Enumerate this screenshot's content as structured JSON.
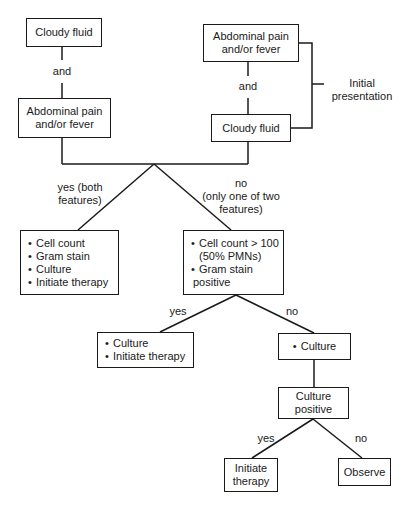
{
  "diagram": {
    "top_left": {
      "box1": "Cloudy fluid",
      "connector": "and",
      "box2_line1": "Abdominal pain",
      "box2_line2": "and/or fever"
    },
    "top_right": {
      "box1_line1": "Abdominal pain",
      "box1_line2": "and/or fever",
      "connector": "and",
      "box2": "Cloudy fluid"
    },
    "initial_presentation": {
      "line1": "Initial",
      "line2": "presentation"
    },
    "branch1": {
      "yes_line1": "yes (both",
      "yes_line2": "features)",
      "no_line1": "no",
      "no_line2": "(only one of two",
      "no_line3": "features)"
    },
    "yes_box": {
      "items": [
        "Cell count",
        "Gram stain",
        "Culture",
        "Initiate therapy"
      ]
    },
    "no_box": {
      "item1_line1": "Cell count > 100",
      "item1_line2": "(50% PMNs)",
      "item2_line1": "Gram stain",
      "item2_line2": "positive"
    },
    "branch2": {
      "yes": "yes",
      "no": "no"
    },
    "branch2_yes_box": {
      "items": [
        "Culture",
        "Initiate therapy"
      ]
    },
    "branch2_no_box": {
      "items": [
        "Culture"
      ]
    },
    "culture_positive": {
      "line1": "Culture",
      "line2": "positive"
    },
    "branch3": {
      "yes": "yes",
      "no": "no"
    },
    "final_yes": {
      "line1": "Initiate",
      "line2": "therapy"
    },
    "final_no": "Observe"
  },
  "colors": {
    "line": "#1a1a1a",
    "background": "#ffffff"
  }
}
